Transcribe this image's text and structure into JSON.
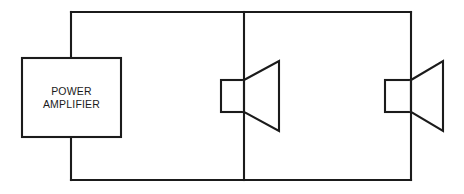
{
  "diagram": {
    "type": "schematic",
    "background_color": "#ffffff",
    "line_color": "#1b1b1b",
    "line_width_px": 2,
    "canvas": {
      "width": 464,
      "height": 194
    }
  },
  "components": {
    "amplifier": {
      "name": "power-amplifier",
      "label_line_1": "POWER",
      "label_line_2": "AMPLIFIER",
      "shape": "rectangle",
      "x": 22,
      "y": 58,
      "width": 99,
      "height": 79
    },
    "speaker_1": {
      "name": "loudspeaker-1",
      "label": "",
      "shape": "loudspeaker",
      "body_x": 221,
      "body_y": 80,
      "body_width": 24,
      "body_height": 32,
      "cone_tip_x": 279,
      "cone_top_y": 61,
      "cone_bottom_y": 131
    },
    "speaker_2": {
      "name": "loudspeaker-2",
      "label": "",
      "shape": "loudspeaker",
      "body_x": 385,
      "body_y": 80,
      "body_width": 26,
      "body_height": 32,
      "cone_tip_x": 443,
      "cone_top_y": 61,
      "cone_bottom_y": 131
    }
  },
  "wiring": {
    "loop_left_x": 71,
    "loop_right_x": 411,
    "loop_top_y": 12,
    "loop_bottom_y": 180,
    "branch_x": 244,
    "nodes": [
      {
        "name": "amplifier-top-terminal",
        "x": 71,
        "y": 58
      },
      {
        "name": "amplifier-bottom-terminal",
        "x": 71,
        "y": 137
      },
      {
        "name": "branch-top-node",
        "x": 244,
        "y": 12
      },
      {
        "name": "branch-bottom-node",
        "x": 244,
        "y": 180
      }
    ]
  }
}
